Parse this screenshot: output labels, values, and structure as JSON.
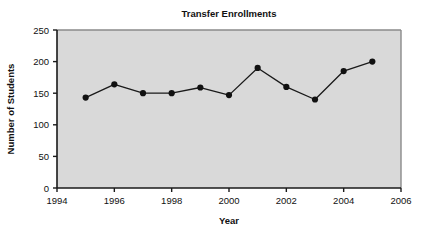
{
  "chart_data": {
    "type": "line",
    "title": "Transfer Enrollments",
    "xlabel": "Year",
    "ylabel": "Number of Students",
    "x": [
      1995,
      1996,
      1997,
      1998,
      1999,
      2000,
      2001,
      2002,
      2003,
      2004,
      2005
    ],
    "values": [
      143,
      164,
      150,
      150,
      159,
      147,
      190,
      160,
      140,
      185,
      200
    ],
    "series": [
      {
        "name": "Transfer Enrollments",
        "values": [
          143,
          164,
          150,
          150,
          159,
          147,
          190,
          160,
          140,
          185,
          200
        ]
      }
    ],
    "xlim": [
      1994,
      2006
    ],
    "ylim": [
      0,
      250
    ],
    "xticks": [
      1994,
      1996,
      1998,
      2000,
      2002,
      2004,
      2006
    ],
    "xtick_labels": [
      "1994",
      "1996",
      "1998",
      "2000",
      "2002",
      "2004",
      "2006"
    ],
    "yticks": [
      0,
      50,
      100,
      150,
      200,
      250
    ],
    "ytick_labels": [
      "0",
      "50",
      "100",
      "150",
      "200",
      "250"
    ],
    "grid": false,
    "legend": null,
    "marker": "filled-circle",
    "line_color": "#1a1a1a",
    "marker_color": "#111111",
    "plot_background": "#d9d9d9",
    "plot_border_color": "#8a8a8a",
    "axis_color": "#1a1a1a",
    "page_background": "#ffffff"
  }
}
